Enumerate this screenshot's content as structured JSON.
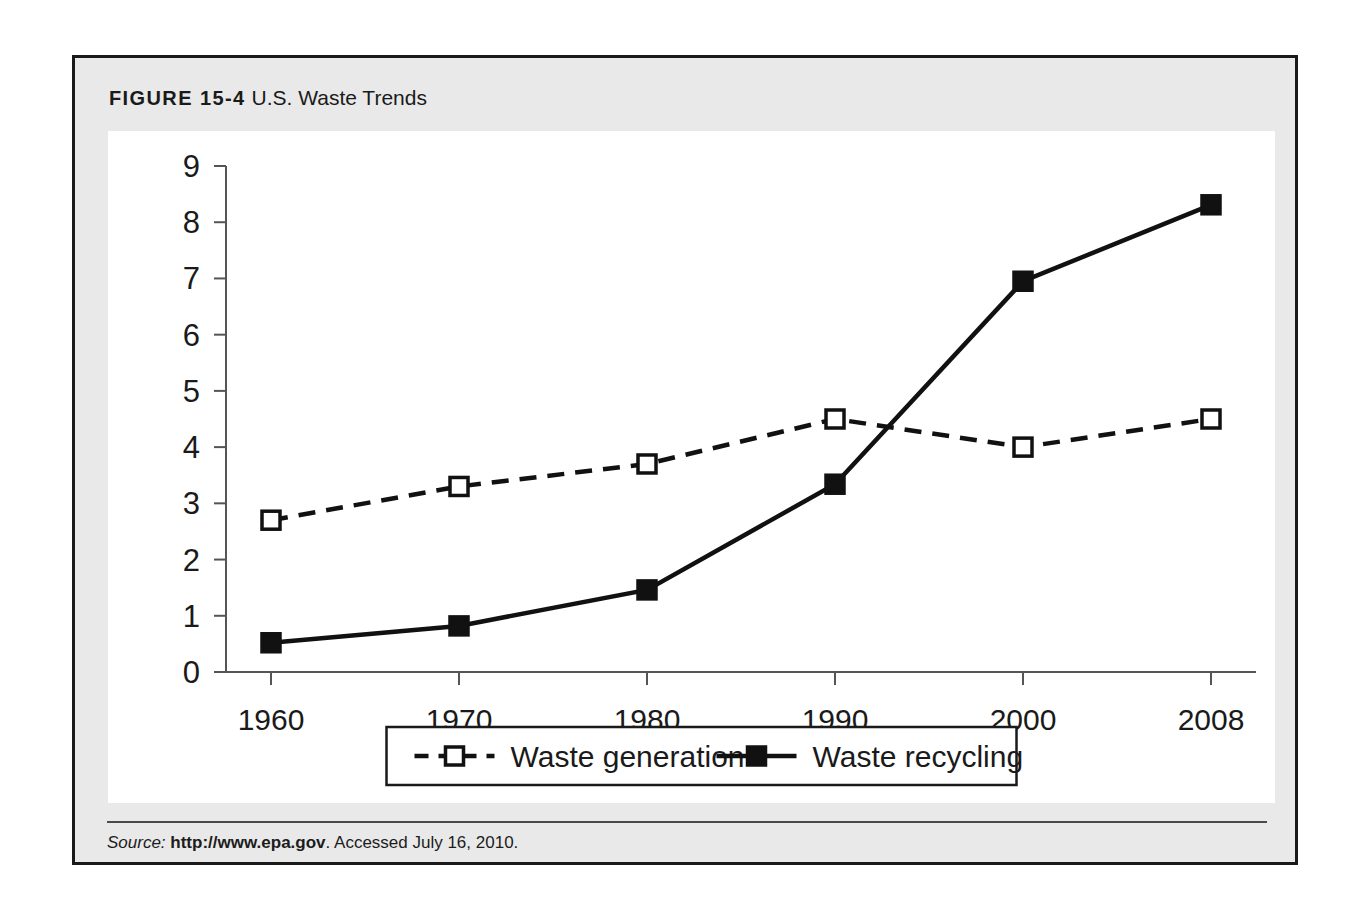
{
  "figure": {
    "label": "FIGURE 15-4",
    "name": "U.S. Waste Trends"
  },
  "source": {
    "label": "Source:",
    "url": "http://www.epa.gov",
    "accessed": ". Accessed July 16, 2010."
  },
  "colors": {
    "frame_border": "#1a1a1a",
    "panel_background": "#e9e9e9",
    "plot_background": "#ffffff",
    "axis": "#555555",
    "series_line": "#111111",
    "rule": "#4a4a4a"
  },
  "chart_data": {
    "type": "line",
    "title": "U.S. Waste Trends",
    "xlabel": "",
    "ylabel": "",
    "categories": [
      "1960",
      "1970",
      "1980",
      "1990",
      "2000",
      "2008"
    ],
    "ylim": [
      0,
      9
    ],
    "yticks": [
      "0",
      "1",
      "2",
      "3",
      "4",
      "5",
      "6",
      "7",
      "8",
      "9"
    ],
    "grid": false,
    "legend_position": "bottom",
    "series": [
      {
        "name": "Waste generation",
        "marker": "open-square",
        "linestyle": "dashed",
        "values": [
          2.7,
          3.3,
          3.7,
          4.5,
          4.0,
          4.5
        ]
      },
      {
        "name": "Waste recycling",
        "marker": "filled-square",
        "linestyle": "solid",
        "values": [
          0.52,
          0.82,
          1.46,
          3.34,
          6.95,
          8.31
        ]
      }
    ]
  }
}
